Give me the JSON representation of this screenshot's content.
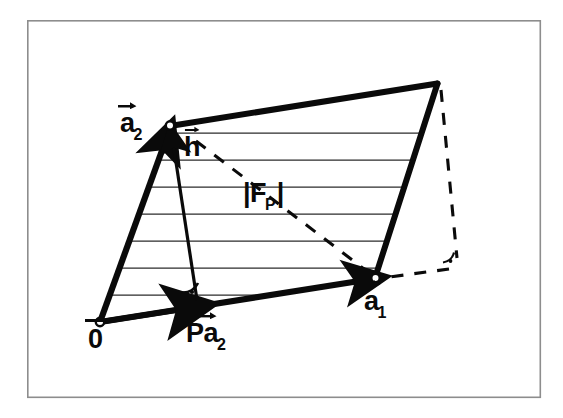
{
  "figure": {
    "background_color": "#ffffff",
    "ink_color": "#0a0a0a",
    "frame": {
      "name": "outer-frame",
      "x": 27,
      "y": 20,
      "width": 514,
      "height": 378,
      "stroke_color": "#8d8d8d",
      "stroke_width": 1.6
    },
    "hatching": {
      "line_count": 7,
      "stroke_color": "#2b2b2b",
      "stroke_width": 1.2,
      "description": "horizontal shading lines filling the parallelogram"
    }
  },
  "vertices": {
    "origin": {
      "x": 100,
      "y": 322,
      "marker": "open-circle"
    },
    "a1": {
      "x": 375,
      "y": 278,
      "marker": "open-circle"
    },
    "a2": {
      "x": 170,
      "y": 126,
      "marker": "open-circle"
    },
    "a1_plus_a2": {
      "x": 437,
      "y": 83,
      "marker": "none"
    },
    "h_foot": {
      "x": 197,
      "y": 298,
      "marker": "none"
    },
    "dashed_corner": {
      "x": 455,
      "y": 265,
      "marker": "none"
    }
  },
  "labels": {
    "origin": {
      "text": "0",
      "accent": "overbar",
      "x": 88,
      "y": 326,
      "font_size": 27
    },
    "a1": {
      "text": "a",
      "subscript": "1",
      "accent": "vector-arrow",
      "x": 364,
      "y": 288,
      "font_size": 27
    },
    "a2": {
      "text": "a",
      "subscript": "2",
      "accent": "vector-arrow",
      "x": 120,
      "y": 110,
      "font_size": 27
    },
    "h": {
      "text": "h",
      "accent": "vector-arrow",
      "x": 184,
      "y": 134,
      "font_size": 27
    },
    "p_a2": {
      "text": "Pa",
      "subscript": "2",
      "accent": "vector-arrow",
      "x": 186,
      "y": 320,
      "font_size": 27
    },
    "area": {
      "text": "|F",
      "subscript": "P",
      "text_tail": "|",
      "x": 243,
      "y": 180,
      "font_size": 27
    }
  },
  "angle_markers": [
    {
      "name": "right-angle-at-h-foot",
      "x": 197,
      "y": 298,
      "radius": 16,
      "type": "quarter-arc-with-dot"
    },
    {
      "name": "right-angle-at-dashed-corner",
      "x": 455,
      "y": 265,
      "radius": 14,
      "type": "quarter-arc-with-dot"
    }
  ],
  "vectors": [
    {
      "name": "vector-a2",
      "from": "origin",
      "to": "a2",
      "style": "solid-thick-arrow"
    },
    {
      "name": "vector-a1",
      "from": "origin",
      "to": "a1",
      "style": "solid-thick-arrow"
    },
    {
      "name": "vector-h",
      "from": "h_foot",
      "to": "a2",
      "style": "solid-thin-arrow"
    },
    {
      "name": "vector-p-a2",
      "from": "origin",
      "to": "h_foot",
      "style": "solid-thick-arrow"
    }
  ],
  "edges": [
    {
      "name": "edge-a2-to-top",
      "from": "a2",
      "to": "a1_plus_a2",
      "style": "solid-thick"
    },
    {
      "name": "edge-a1-to-top",
      "from": "a1",
      "to": "a1_plus_a2",
      "style": "solid-thick"
    }
  ],
  "dashed_lines": [
    {
      "name": "dashed-diagonal-a2-to-a1",
      "from": "a2",
      "to": "a1"
    },
    {
      "name": "dashed-top-to-corner",
      "from": "a1_plus_a2",
      "to": "dashed_corner"
    },
    {
      "name": "dashed-corner-to-a1",
      "from": "dashed_corner",
      "to": "a1"
    }
  ]
}
